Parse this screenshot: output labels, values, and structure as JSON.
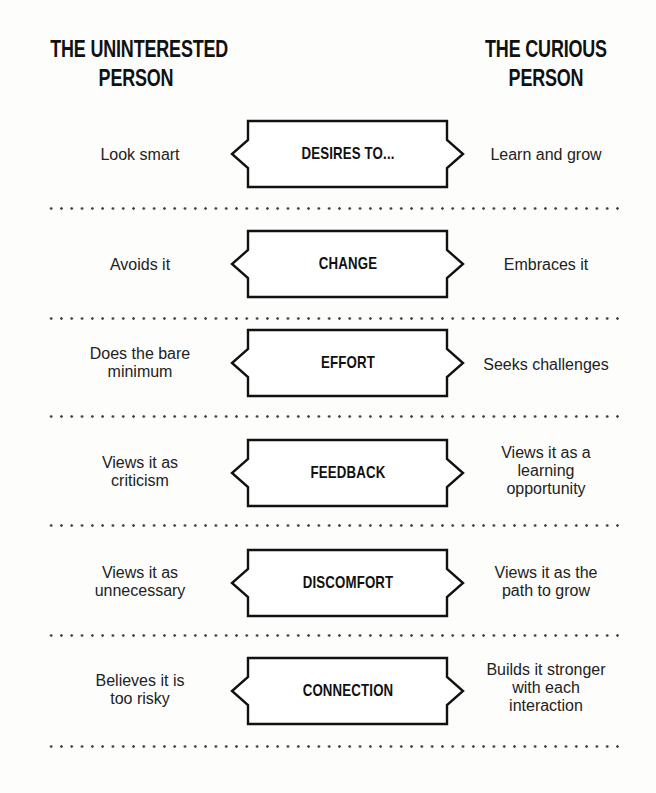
{
  "headings": {
    "left": "THE UNINTERESTED PERSON",
    "left_line1": "THE UNINTERESTED",
    "left_line2": "PERSON",
    "right": "THE CURIOUS PERSON",
    "right_line1": "THE CURIOUS",
    "right_line2": "PERSON"
  },
  "rows": [
    {
      "topic": "DESIRES TO...",
      "uninterested": [
        "Look smart"
      ],
      "curious": [
        "Learn and grow"
      ]
    },
    {
      "topic": "CHANGE",
      "uninterested": [
        "Avoids it"
      ],
      "curious": [
        "Embraces it"
      ]
    },
    {
      "topic": "EFFORT",
      "uninterested": [
        "Does the bare",
        "minimum"
      ],
      "curious": [
        "Seeks challenges"
      ]
    },
    {
      "topic": "FEEDBACK",
      "uninterested": [
        "Views it as",
        "criticism"
      ],
      "curious": [
        "Views it as a",
        "learning",
        "opportunity"
      ]
    },
    {
      "topic": "DISCOMFORT",
      "uninterested": [
        "Views it as",
        "unnecessary"
      ],
      "curious": [
        "Views it as the",
        "path to grow"
      ]
    },
    {
      "topic": "CONNECTION",
      "uninterested": [
        "Believes it is",
        "too risky"
      ],
      "curious": [
        "Builds it stronger",
        "with each",
        "interaction"
      ]
    }
  ],
  "colors": {
    "ink": "#111111",
    "text": "#222222",
    "background": "#fdfdfc",
    "dots": "#444444"
  }
}
